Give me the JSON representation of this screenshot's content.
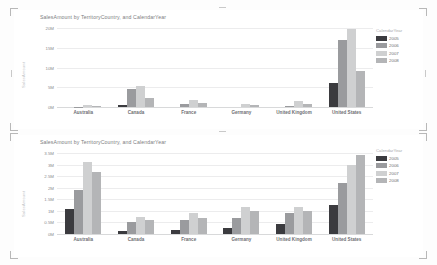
{
  "app": {
    "background": "#fdfdfd"
  },
  "palette": {
    "2005": "#3b3b3f",
    "2006": "#9a9b9e",
    "2007": "#cfd0d1",
    "2008": "#b4b5b7",
    "gridline": "#ececed",
    "axis": "#d8d9da",
    "title_text": "#7d7e82"
  },
  "visuals": [
    {
      "id": "top",
      "title": "SalesAmount by TerritoryCountry, and CalendarYear",
      "y_axis_title": "SalesAmount",
      "legend": {
        "title": "CalendarYear",
        "items": [
          {
            "label": "2005",
            "color": "#3b3b3f"
          },
          {
            "label": "2006",
            "color": "#9a9b9e"
          },
          {
            "label": "2007",
            "color": "#cfd0d1"
          },
          {
            "label": "2008",
            "color": "#b4b5b7"
          }
        ]
      },
      "chart_data": {
        "type": "bar",
        "title": "SalesAmount by TerritoryCountry, and CalendarYear",
        "xlabel": "",
        "ylabel": "SalesAmount",
        "ylim": [
          0,
          20000000
        ],
        "yticks": [
          0,
          5000000,
          10000000,
          15000000,
          20000000
        ],
        "ytick_labels": [
          "0M",
          "5M",
          "10M",
          "15M",
          "20M"
        ],
        "grid": true,
        "legend_position": "right",
        "categories": [
          "Australia",
          "Canada",
          "France",
          "Germany",
          "United Kingdom",
          "United States"
        ],
        "series": [
          {
            "name": "2005",
            "color": "#3b3b3f",
            "values": [
              0,
              600000,
              0,
              0,
              0,
              6000000
            ]
          },
          {
            "name": "2006",
            "color": "#9a9b9e",
            "values": [
              100000,
              4500000,
              700000,
              0,
              300000,
              17000000
            ]
          },
          {
            "name": "2007",
            "color": "#cfd0d1",
            "values": [
              450000,
              5300000,
              1800000,
              700000,
              1600000,
              19800000
            ]
          },
          {
            "name": "2008",
            "color": "#b4b5b7",
            "values": [
              350000,
              2200000,
              900000,
              400000,
              700000,
              9000000
            ]
          }
        ]
      }
    },
    {
      "id": "bottom",
      "title": "SalesAmount by TerritoryCountry, and CalendarYear",
      "y_axis_title": "SalesAmount",
      "legend": {
        "title": "CalendarYear",
        "items": [
          {
            "label": "2005",
            "color": "#3b3b3f"
          },
          {
            "label": "2006",
            "color": "#9a9b9e"
          },
          {
            "label": "2007",
            "color": "#cfd0d1"
          },
          {
            "label": "2008",
            "color": "#b4b5b7"
          }
        ]
      },
      "chart_data": {
        "type": "bar",
        "title": "SalesAmount by TerritoryCountry, and CalendarYear",
        "xlabel": "",
        "ylabel": "SalesAmount",
        "ylim": [
          0,
          3500000
        ],
        "yticks": [
          0,
          500000,
          1000000,
          1500000,
          2000000,
          2500000,
          3000000,
          3500000
        ],
        "ytick_labels": [
          "0M",
          "0.5M",
          "1M",
          "1.5M",
          "2M",
          "2.5M",
          "3M",
          "3.5M"
        ],
        "grid": true,
        "legend_position": "right",
        "categories": [
          "Australia",
          "Canada",
          "France",
          "Germany",
          "United Kingdom",
          "United States"
        ],
        "series": [
          {
            "name": "2005",
            "color": "#3b3b3f",
            "values": [
              1100000,
              120000,
              160000,
              270000,
              420000,
              1250000
            ]
          },
          {
            "name": "2006",
            "color": "#9a9b9e",
            "values": [
              1900000,
              520000,
              620000,
              700000,
              900000,
              2200000
            ]
          },
          {
            "name": "2007",
            "color": "#cfd0d1",
            "values": [
              3100000,
              750000,
              900000,
              1150000,
              1150000,
              3000000
            ]
          },
          {
            "name": "2008",
            "color": "#b4b5b7",
            "values": [
              2700000,
              620000,
              700000,
              1000000,
              1000000,
              3400000
            ]
          }
        ]
      }
    }
  ]
}
